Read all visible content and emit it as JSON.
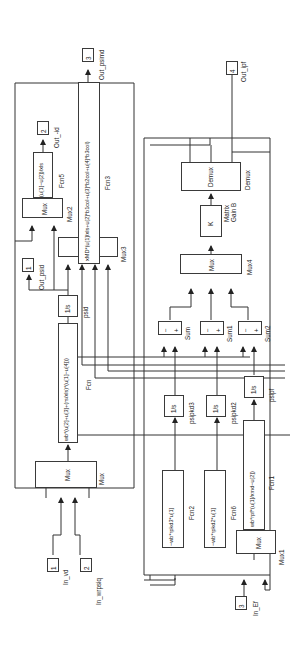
{
  "diagram": {
    "type": "simulink-block-diagram",
    "orientation": "rotated-90-ccw",
    "line_color": "#333333",
    "background": "#ffffff"
  },
  "inports": [
    {
      "num": "1",
      "label": "In_vd"
    },
    {
      "num": "2",
      "label": "In_wrpsiq"
    },
    {
      "num": "3",
      "label": "In_Ef"
    }
  ],
  "outports": [
    {
      "num": "1",
      "label": "Out_psid"
    },
    {
      "num": "2",
      "label": "Out_-id"
    },
    {
      "num": "3",
      "label": "Out_psimd"
    },
    {
      "num": "4",
      "label": "Out_ipf"
    }
  ],
  "muxes": {
    "mux": {
      "text": "Mux",
      "label": "Mux"
    },
    "mux1": {
      "text": "Mux",
      "label": "Mux1"
    },
    "mux2": {
      "text": "Mux",
      "label": "Mux2"
    },
    "mux3": {
      "text": "Mux",
      "label": "Mux3"
    },
    "mux4": {
      "text": "Mux",
      "label": "Mux4"
    }
  },
  "fcns": {
    "fcn": {
      "expr": "wb*(u[2]+u[3]+(rs/xls)*(u[1]−u[4]))",
      "label": "Fcn"
    },
    "fcn1": {
      "expr": "wb*rpf*(u[1]/xmd−u[2])",
      "label": "Fcn1"
    },
    "fcn2": {
      "expr": "−wb*rpkd3*u[1]",
      "label": "Fcn2"
    },
    "fcn3": {
      "expr": "xMD*(u[1]/xls+u[2]*b1col+u[3]*b2col+u[4]*b3col)",
      "label": "Fcn3"
    },
    "fcn5": {
      "expr": "(u[1]−u[2])/xls",
      "label": "Fcn5"
    },
    "fcn6": {
      "expr": "−wb*rpkd2*u[1]",
      "label": "Fcn6"
    }
  },
  "integrators": {
    "psid": {
      "text": "1/s",
      "label": "psid"
    },
    "psipkd3": {
      "text": "1/s",
      "label": "psipkd3"
    },
    "psipkd2": {
      "text": "1/s",
      "label": "psipkd2"
    },
    "psipf": {
      "text": "1/s",
      "label": "psipf"
    }
  },
  "sums": {
    "sum": {
      "signs": [
        "−",
        "+"
      ],
      "label": "Sum"
    },
    "sum1": {
      "signs": [
        "−",
        "+"
      ],
      "label": "Sum1"
    },
    "sum2": {
      "signs": [
        "−",
        "+"
      ],
      "label": "Sum2"
    }
  },
  "gain": {
    "text": "K",
    "label": "Matrix\nGain B",
    "label_line1": "Matrix",
    "label_line2": "Gain B"
  },
  "demux": {
    "text": "Demux",
    "label": "Demux"
  }
}
